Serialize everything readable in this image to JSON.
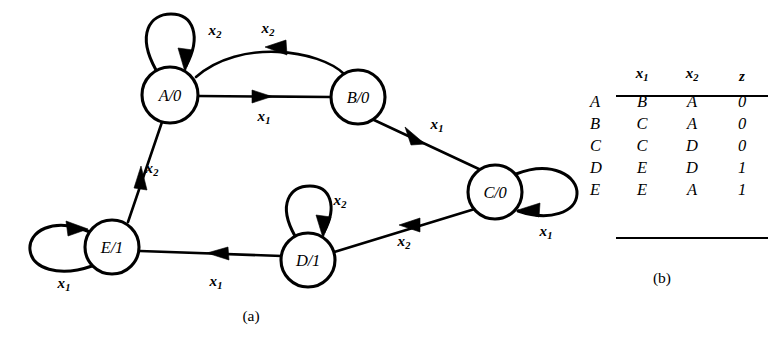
{
  "figure": {
    "caption_a": "(a)",
    "caption_b": "(b)"
  },
  "diagram": {
    "type": "mealy-state-diagram",
    "nodes": [
      {
        "id": "A",
        "label_state": "A",
        "label_output": "0",
        "label": "A/0",
        "cx": 170,
        "cy": 95,
        "r": 28
      },
      {
        "id": "B",
        "label_state": "B",
        "label_output": "0",
        "label": "B/0",
        "cx": 358,
        "cy": 97,
        "r": 27
      },
      {
        "id": "C",
        "label_state": "C",
        "label_output": "0",
        "label": "C/0",
        "cx": 495,
        "cy": 192,
        "r": 27
      },
      {
        "id": "D",
        "label_state": "D",
        "label_output": "1",
        "label": "D/1",
        "cx": 308,
        "cy": 260,
        "r": 27
      },
      {
        "id": "E",
        "label_state": "E",
        "label_output": "1",
        "label": "E/1",
        "cx": 112,
        "cy": 247,
        "r": 27
      }
    ],
    "edges": [
      {
        "from": "A",
        "to": "A",
        "input": "x",
        "sub": "2",
        "label": "x2",
        "kind": "self-loop",
        "label_x": 215,
        "label_y": 32
      },
      {
        "from": "A",
        "to": "B",
        "input": "x",
        "sub": "1",
        "label": "x1",
        "kind": "straight",
        "label_x": 264,
        "label_y": 118
      },
      {
        "from": "B",
        "to": "A",
        "input": "x",
        "sub": "2",
        "label": "x2",
        "kind": "arc",
        "label_x": 268,
        "label_y": 30
      },
      {
        "from": "B",
        "to": "C",
        "input": "x",
        "sub": "1",
        "label": "x1",
        "kind": "straight",
        "label_x": 437,
        "label_y": 126
      },
      {
        "from": "C",
        "to": "D",
        "input": "x",
        "sub": "2",
        "label": "x2",
        "kind": "straight",
        "label_x": 404,
        "label_y": 243
      },
      {
        "from": "C",
        "to": "C",
        "input": "x",
        "sub": "1",
        "label": "x1",
        "kind": "self-loop",
        "label_x": 546,
        "label_y": 233
      },
      {
        "from": "D",
        "to": "D",
        "input": "x",
        "sub": "2",
        "label": "x2",
        "kind": "self-loop",
        "label_x": 340,
        "label_y": 202
      },
      {
        "from": "D",
        "to": "E",
        "input": "x",
        "sub": "1",
        "label": "x1",
        "kind": "straight",
        "label_x": 216,
        "label_y": 283
      },
      {
        "from": "E",
        "to": "E",
        "input": "x",
        "sub": "1",
        "label": "x1",
        "kind": "self-loop",
        "label_x": 64,
        "label_y": 285
      },
      {
        "from": "E",
        "to": "A",
        "input": "x",
        "sub": "2",
        "label": "x2",
        "kind": "straight",
        "label_x": 152,
        "label_y": 170
      }
    ]
  },
  "table": {
    "headers": {
      "row_label": "",
      "x1": "x",
      "x1_sub": "1",
      "x2": "x",
      "x2_sub": "2",
      "z": "z"
    },
    "rows": [
      {
        "state": "A",
        "next_x1": "B",
        "next_x2": "A",
        "z": "0"
      },
      {
        "state": "B",
        "next_x1": "C",
        "next_x2": "A",
        "z": "0"
      },
      {
        "state": "C",
        "next_x1": "C",
        "next_x2": "D",
        "z": "0"
      },
      {
        "state": "D",
        "next_x1": "E",
        "next_x2": "D",
        "z": "1"
      },
      {
        "state": "E",
        "next_x1": "E",
        "next_x2": "A",
        "z": "1"
      }
    ]
  },
  "colors": {
    "ink": "#000000",
    "paper": "#ffffff"
  }
}
